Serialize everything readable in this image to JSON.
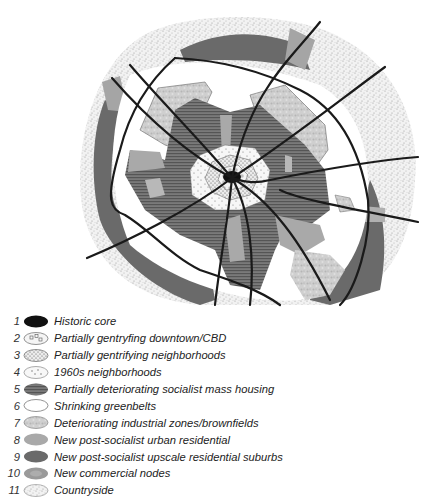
{
  "figure": {
    "type": "schematic urban zone model map"
  },
  "legend": {
    "items": [
      {
        "num": "1",
        "label": "Historic core",
        "swatch": "solid-black",
        "color": "#111111"
      },
      {
        "num": "2",
        "label": "Partially gentryfing downtown/CBD",
        "swatch": "squares-pattern",
        "color": "#f4f4f4"
      },
      {
        "num": "3",
        "label": "Partially gentrifying neighborhoods",
        "swatch": "dense-dots",
        "color": "#e6e6e6"
      },
      {
        "num": "4",
        "label": "1960s neighborhoods",
        "swatch": "sparse-dots",
        "color": "#f6f6f6"
      },
      {
        "num": "5",
        "label": "Partially deteriorating socialist mass housing",
        "swatch": "horizontal-stripes",
        "color": "#6e6e6e"
      },
      {
        "num": "6",
        "label": "Shrinking greenbelts",
        "swatch": "white",
        "color": "#ffffff"
      },
      {
        "num": "7",
        "label": "Deteriorating industrial zones/brownfields",
        "swatch": "mottled-light",
        "color": "#c8c8c8"
      },
      {
        "num": "8",
        "label": "New post-socialist urban residential",
        "swatch": "light-gray",
        "color": "#a9a9a9"
      },
      {
        "num": "9",
        "label": "New post-socialist upscale residential suburbs",
        "swatch": "dark-gray",
        "color": "#6a6a6a"
      },
      {
        "num": "10",
        "label": "New commercial nodes",
        "swatch": "mottled-mid",
        "color": "#9a9a9a"
      },
      {
        "num": "11",
        "label": "Countryside",
        "swatch": "speckled",
        "color": "#e8e8e8"
      }
    ]
  }
}
